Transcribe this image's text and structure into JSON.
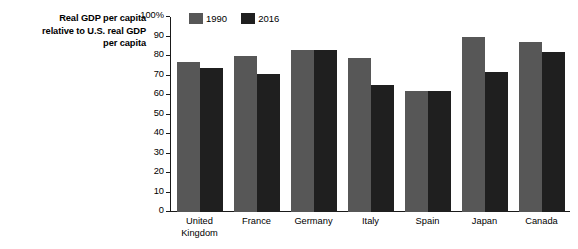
{
  "chart_data": {
    "type": "bar",
    "title": "",
    "subtitle": "",
    "xlabel": "",
    "ylabel": "Real GDP per capita relative to U.S. real GDP per capita",
    "ylabel_lines": [
      "Real GDP per capita",
      "relative to U.S. real GDP",
      "per capita"
    ],
    "ylim": [
      0,
      100
    ],
    "yticks": [
      0,
      10,
      20,
      30,
      40,
      50,
      60,
      70,
      80,
      90,
      100
    ],
    "ytick_labels": [
      "0",
      "10",
      "20",
      "30",
      "40",
      "50",
      "60",
      "70",
      "80",
      "90",
      "100%"
    ],
    "grid": false,
    "legend_position": "top-left-inside",
    "categories": [
      "United Kingdom",
      "France",
      "Germany",
      "Italy",
      "Spain",
      "Japan",
      "Canada"
    ],
    "category_lines": [
      [
        "United",
        "Kingdom"
      ],
      [
        "France"
      ],
      [
        "Germany"
      ],
      [
        "Italy"
      ],
      [
        "Spain"
      ],
      [
        "Japan"
      ],
      [
        "Canada"
      ]
    ],
    "series": [
      {
        "name": "1990",
        "color": "#575757",
        "values": [
          77,
          80,
          83,
          79,
          62,
          90,
          87
        ]
      },
      {
        "name": "2016",
        "color": "#1f1f1f",
        "values": [
          74,
          71,
          83,
          65,
          62,
          72,
          82
        ]
      }
    ]
  },
  "colors": {
    "background": "#ffffff",
    "axis": "#1a1a1a",
    "series_1990": "#575757",
    "series_2016": "#1f1f1f"
  }
}
